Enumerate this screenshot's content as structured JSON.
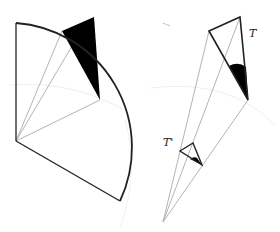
{
  "diagram": {
    "left_panel": {
      "description": "Circular sector with apex at left, rays to arc points, shaded black triangle near top of arc"
    },
    "right_panel": {
      "description": "Large triangle T with shaded angle and small similar triangle T' on rays from a common vertex",
      "labels": {
        "T": "T",
        "T_prime": "T'"
      }
    },
    "colors": {
      "stroke": "#222222",
      "ray": "#aaaaaa",
      "faint": "#eeeeee",
      "fill": "#000000"
    }
  }
}
